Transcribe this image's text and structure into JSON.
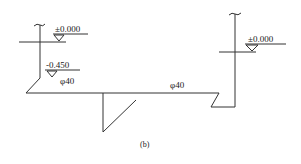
{
  "diagram": {
    "caption": "(b)",
    "stroke_color": "#333333",
    "left_riser": {
      "top_elevation_label": "±0.000",
      "lower_elevation_label": "-0.450",
      "pipe_label": "φ40"
    },
    "main_pipe": {
      "pipe_label": "φ40"
    },
    "right_riser": {
      "top_elevation_label": "±0.000"
    }
  }
}
